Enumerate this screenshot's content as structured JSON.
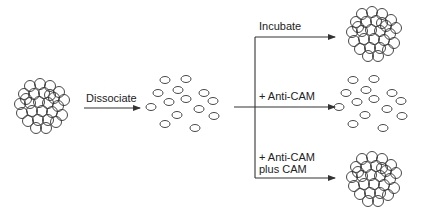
{
  "diagram": {
    "type": "process-flow",
    "colors": {
      "stroke": "#333333",
      "background": "#ffffff"
    },
    "nodes": [
      {
        "id": "start",
        "state": "aggregated-cluster"
      },
      {
        "id": "dissociated",
        "state": "scattered-cells"
      },
      {
        "id": "incubate-result",
        "state": "aggregated-cluster"
      },
      {
        "id": "anticam-result",
        "state": "scattered-cells"
      },
      {
        "id": "anticam-plus-cam-result",
        "state": "aggregated-cluster"
      }
    ],
    "edges": [
      {
        "from": "start",
        "to": "dissociated",
        "label": "Dissociate"
      },
      {
        "from": "dissociated",
        "to": "incubate-result",
        "label": "Incubate"
      },
      {
        "from": "dissociated",
        "to": "anticam-result",
        "label": "+ Anti-CAM"
      },
      {
        "from": "dissociated",
        "to": "anticam-plus-cam-result",
        "label_line1": "+ Anti-CAM",
        "label_line2": "plus CAM"
      }
    ]
  }
}
